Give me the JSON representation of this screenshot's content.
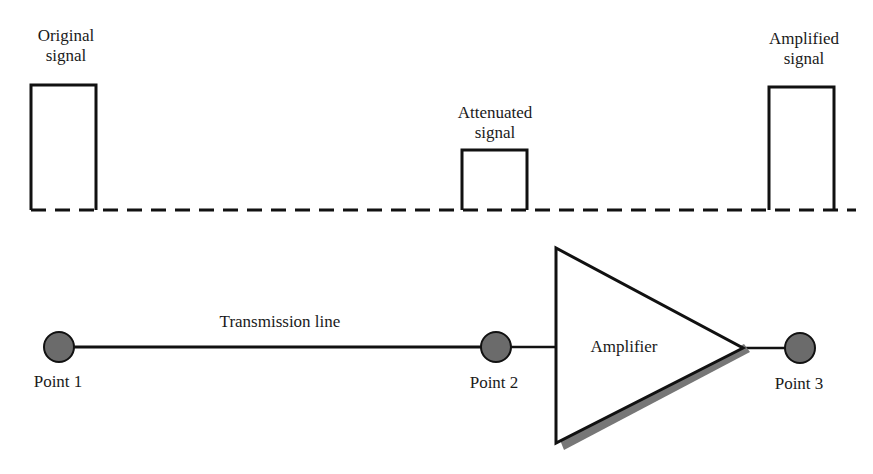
{
  "signals": {
    "original": {
      "line1": "Original",
      "line2": "signal"
    },
    "attenuated": {
      "line1": "Attenuated",
      "line2": "signal"
    },
    "amplified": {
      "line1": "Amplified",
      "line2": "signal"
    }
  },
  "transmission": {
    "line_label": "Transmission line",
    "amplifier_label": "Amplifier",
    "points": [
      {
        "label": "Point 1"
      },
      {
        "label": "Point 2"
      },
      {
        "label": "Point 3"
      }
    ]
  },
  "colors": {
    "stroke": "#111111",
    "node_fill": "#6b6b6b",
    "shadow": "#777777",
    "background": "#ffffff"
  }
}
